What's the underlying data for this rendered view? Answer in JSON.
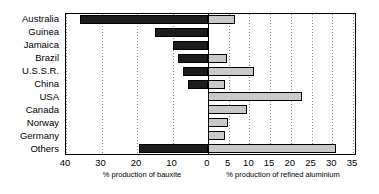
{
  "chart_data": {
    "type": "bar",
    "orientation": "horizontal",
    "subtype": "bidirectional-pyramid",
    "title": "",
    "categories": [
      "Australia",
      "Guinea",
      "Jamaica",
      "Brazil",
      "U.S.S.R.",
      "China",
      "USA",
      "Canada",
      "Norway",
      "Germany",
      "Others"
    ],
    "series": [
      {
        "name": "% production of bauxite",
        "side": "left",
        "color": "#1c1c1c",
        "axis_label": "% production of bauxite",
        "axis_ticks": [
          40,
          30,
          20,
          10,
          0
        ],
        "axis_range": [
          0,
          40
        ],
        "values": [
          36.0,
          15.0,
          10.0,
          8.5,
          7.0,
          5.5,
          0.0,
          0.0,
          0.0,
          0.0,
          19.5
        ]
      },
      {
        "name": "% production of refined aluminium",
        "side": "right",
        "color": "#c8c8c8",
        "axis_label": "% production of refined aluminium",
        "axis_ticks": [
          0,
          5,
          10,
          15,
          20,
          25,
          30,
          35
        ],
        "axis_range": [
          0,
          35
        ],
        "values": [
          6.5,
          0.0,
          0.0,
          4.5,
          11.0,
          4.0,
          22.8,
          9.3,
          4.8,
          4.2,
          31.0
        ]
      }
    ],
    "grid": true,
    "legend": "none",
    "xlabel_left": "% production of bauxite",
    "xlabel_right": "% production of refined aluminium",
    "ylabel": ""
  },
  "layout": {
    "left_axis_ticks": [
      "40",
      "30",
      "20",
      "10",
      "0"
    ],
    "right_axis_ticks": [
      "0",
      "5",
      "10",
      "15",
      "20",
      "25",
      "30",
      "35"
    ],
    "caption_left": "% production of bauxite",
    "caption_right": "% production of refined aluminium"
  }
}
